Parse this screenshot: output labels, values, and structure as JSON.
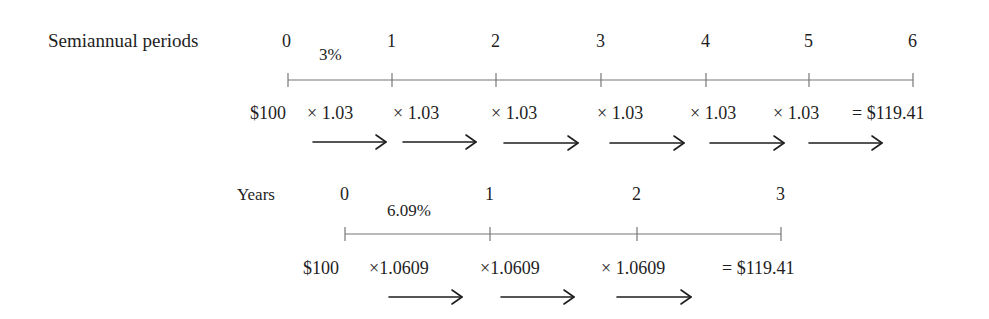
{
  "semiannual": {
    "label": "Semiannual periods",
    "periods": [
      "0",
      "1",
      "2",
      "3",
      "4",
      "5",
      "6"
    ],
    "rate": "3%",
    "principal": "$100",
    "multipliers": [
      "× 1.03",
      "× 1.03",
      "× 1.03",
      "× 1.03",
      "× 1.03",
      "× 1.03"
    ],
    "result": "= $119.41"
  },
  "annual": {
    "label": "Years",
    "periods": [
      "0",
      "1",
      "2",
      "3"
    ],
    "rate": "6.09%",
    "principal": "$100",
    "multipliers": [
      "×1.0609",
      "×1.0609",
      "× 1.0609"
    ],
    "result": "= $119.41"
  },
  "colors": {
    "text": "#1e1e1e",
    "axis": "#777777",
    "arrow": "#1e1e1e"
  }
}
